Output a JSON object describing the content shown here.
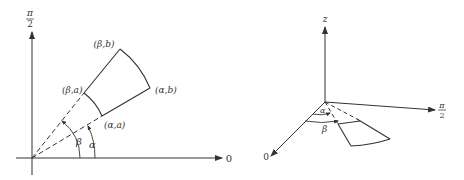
{
  "left_diagram": {
    "y_axis_label_top": "π",
    "y_axis_label_bottom": "2",
    "x_axis_label": "0",
    "corners": {
      "beta_b": "(β,b)",
      "alpha_b": "(α,b)",
      "beta_a": "(β,a)",
      "alpha_a": "(α,a)"
    },
    "angle_beta": "β",
    "angle_alpha": "α"
  },
  "right_diagram": {
    "z_axis_label": "z",
    "pi2_axis_label_top": "π",
    "pi2_axis_label_bottom": "2",
    "zero_axis_label": "0",
    "angle_alpha": "α",
    "angle_beta": "β"
  },
  "colors": {
    "line": "#333333",
    "background": "#ffffff"
  }
}
